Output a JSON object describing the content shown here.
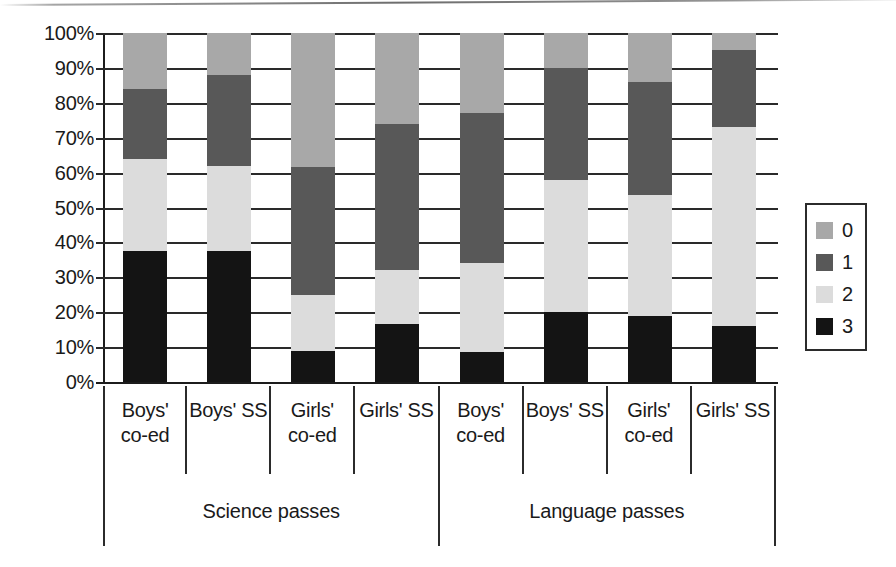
{
  "chart_data": {
    "type": "bar",
    "subtype": "stacked-100-percent",
    "title": "",
    "xlabel": "",
    "ylabel": "",
    "ylim": [
      0,
      100
    ],
    "y_tick_labels": [
      "100%",
      "90%",
      "80%",
      "70%",
      "60%",
      "50%",
      "40%",
      "30%",
      "20%",
      "10%",
      "0%"
    ],
    "y_ticks": [
      100,
      90,
      80,
      70,
      60,
      50,
      40,
      30,
      20,
      10,
      0
    ],
    "grid": true,
    "legend_position": "right",
    "legend_entries": [
      {
        "label": "0",
        "color": "#a8a8a8"
      },
      {
        "label": "1",
        "color": "#585858"
      },
      {
        "label": "2",
        "color": "#dcdcdc"
      },
      {
        "label": "3",
        "color": "#141414"
      }
    ],
    "series": [
      {
        "name": "3",
        "color": "#141414",
        "values": [
          37.5,
          37.5,
          9.0,
          16.5,
          8.5,
          20.0,
          19.0,
          16.0
        ]
      },
      {
        "name": "2",
        "color": "#dcdcdc",
        "values": [
          26.5,
          24.5,
          16.0,
          15.5,
          25.5,
          38.0,
          34.5,
          57.0
        ]
      },
      {
        "name": "1",
        "color": "#585858",
        "values": [
          20.0,
          26.0,
          36.5,
          42.0,
          43.0,
          32.0,
          32.5,
          22.0
        ]
      },
      {
        "name": "0",
        "color": "#a8a8a8",
        "values": [
          16.0,
          12.0,
          38.5,
          26.0,
          23.0,
          10.0,
          14.0,
          5.0
        ]
      }
    ],
    "cumulative_tops": {
      "3": [
        37.5,
        37.5,
        9.0,
        16.5,
        8.5,
        20.0,
        19.0,
        16.0
      ],
      "2": [
        64.0,
        62.0,
        25.0,
        32.0,
        34.0,
        58.0,
        53.5,
        73.0
      ],
      "1": [
        84.0,
        88.0,
        61.5,
        74.0,
        77.0,
        90.0,
        86.0,
        95.0
      ],
      "0": [
        100,
        100,
        100,
        100,
        100,
        100,
        100,
        100
      ]
    },
    "categories": [
      "Boys' co-ed",
      "Boys' SS",
      "Girls' co-ed",
      "Girls' SS",
      "Boys' co-ed",
      "Boys' SS",
      "Girls' co-ed",
      "Girls' SS"
    ],
    "category_lines": [
      [
        "Boys'",
        "co-ed"
      ],
      [
        "Boys' SS",
        ""
      ],
      [
        "Girls'",
        "co-ed"
      ],
      [
        "Girls' SS",
        ""
      ],
      [
        "Boys'",
        "co-ed"
      ],
      [
        "Boys' SS",
        ""
      ],
      [
        "Girls'",
        "co-ed"
      ],
      [
        "Girls' SS",
        ""
      ]
    ],
    "groups": [
      {
        "label": "Science passes",
        "category_count": 4
      },
      {
        "label": "Language passes",
        "category_count": 4
      }
    ]
  },
  "colors": {
    "axis": "#1c1c1c",
    "gridline": "#2a2a2a",
    "text": "#1a1a1a",
    "background": "#ffffff",
    "legend_border": "#2b2b2b"
  }
}
